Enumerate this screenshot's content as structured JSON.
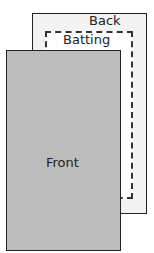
{
  "diagram": {
    "layers": [
      {
        "id": "back",
        "label": "Back",
        "fill": "#f3f3f3",
        "border": "solid"
      },
      {
        "id": "batting",
        "label": "Batting",
        "fill": "#ffffff",
        "border": "dashed"
      },
      {
        "id": "front",
        "label": "Front",
        "fill": "#bcbcbc",
        "border": "solid"
      }
    ]
  }
}
